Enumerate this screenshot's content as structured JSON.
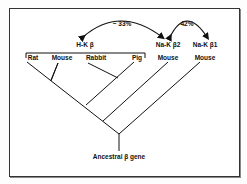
{
  "diagram": {
    "groups": {
      "hk": "H-K β",
      "nak2": "Na-K β2",
      "nak1": "Na-K β1"
    },
    "leaves": [
      "Rat",
      "Mouse",
      "Rabbit",
      "Pig",
      "Mouse",
      "Mouse"
    ],
    "similarities": {
      "hk_nak2": "~ 33%",
      "nak2_nak1": "42%"
    },
    "root": "Ancestral β gene"
  }
}
